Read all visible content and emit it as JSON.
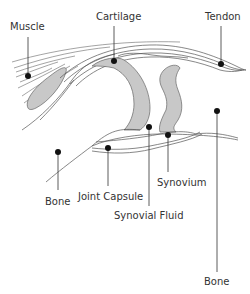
{
  "diagram": {
    "colors": {
      "background": "#ffffff",
      "cartilage_fill": "#c8c8c8",
      "line": "#555555",
      "label": "#333333",
      "marker": "#111111"
    },
    "labels": {
      "muscle": "Muscle",
      "cartilage": "Cartilage",
      "tendon": "Tendon",
      "bone_left": "Bone",
      "joint_capsule": "Joint Capsule",
      "synovial_fluid": "Synovial Fluid",
      "synovium": "Synovium",
      "bone_right": "Bone"
    }
  }
}
